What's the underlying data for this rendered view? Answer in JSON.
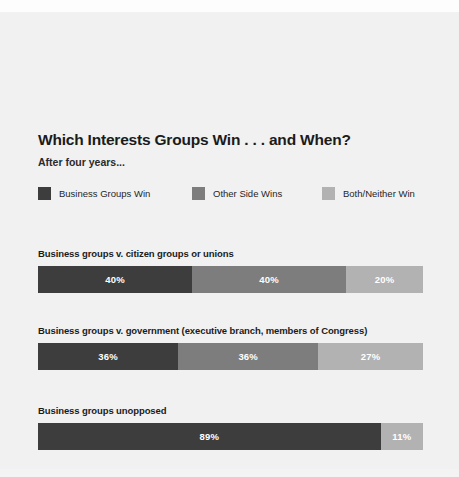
{
  "chart_data": {
    "type": "bar",
    "orientation": "horizontal",
    "stacked": true,
    "normalized": true,
    "title": "Which Interests Groups Win . . . and When?",
    "subtitle": "After four years...",
    "xlabel": "",
    "ylabel": "",
    "grid": false,
    "legend_position": "top",
    "colors": {
      "business_groups_win": "#3d3d3d",
      "other_side_wins": "#7d7d7d",
      "both_neither_win": "#b2b2b2",
      "background": "#f1f1f1",
      "title_text": "#1b1b1b",
      "bar_label_text": "#ffffff"
    },
    "legend": [
      {
        "label": "Business Groups Win",
        "color": "#3d3d3d"
      },
      {
        "label": "Other Side Wins",
        "color": "#7d7d7d"
      },
      {
        "label": "Both/Neither Win",
        "color": "#b2b2b2"
      }
    ],
    "categories": [
      "Business groups v. citizen groups or unions",
      "Business groups v. government (executive branch, members of Congress)",
      "Business groups unopposed"
    ],
    "series": [
      {
        "name": "Business Groups Win",
        "color": "#3d3d3d",
        "values": [
          40,
          36,
          89
        ]
      },
      {
        "name": "Other Side Wins",
        "color": "#7d7d7d",
        "values": [
          40,
          36,
          null
        ]
      },
      {
        "name": "Both/Neither Win",
        "color": "#b2b2b2",
        "values": [
          20,
          27,
          11
        ]
      }
    ],
    "groups": [
      {
        "caption": "Business groups v. citizen groups or unions",
        "segments": [
          {
            "series": "Business Groups Win",
            "value": 40,
            "label": "40%",
            "color": "#3d3d3d",
            "width_pct": 40
          },
          {
            "series": "Other Side Wins",
            "value": 40,
            "label": "40%",
            "color": "#7d7d7d",
            "width_pct": 40
          },
          {
            "series": "Both/Neither Win",
            "value": 20,
            "label": "20%",
            "color": "#b2b2b2",
            "width_pct": 20
          }
        ]
      },
      {
        "caption": "Business groups v. government (executive branch, members of Congress)",
        "segments": [
          {
            "series": "Business Groups Win",
            "value": 36,
            "label": "36%",
            "color": "#3d3d3d",
            "width_pct": 36.4
          },
          {
            "series": "Other Side Wins",
            "value": 36,
            "label": "36%",
            "color": "#7d7d7d",
            "width_pct": 36.4
          },
          {
            "series": "Both/Neither Win",
            "value": 27,
            "label": "27%",
            "color": "#b2b2b2",
            "width_pct": 27.2
          }
        ]
      },
      {
        "caption": "Business groups unopposed",
        "segments": [
          {
            "series": "Business Groups Win",
            "value": 89,
            "label": "89%",
            "color": "#3d3d3d",
            "width_pct": 89
          },
          {
            "series": "Both/Neither Win",
            "value": 11,
            "label": "11%",
            "color": "#b2b2b2",
            "width_pct": 11
          }
        ]
      }
    ]
  }
}
